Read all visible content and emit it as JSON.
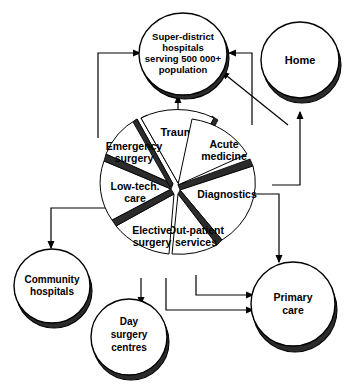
{
  "diagram": {
    "type": "pie-with-satellite-nodes",
    "colors": {
      "fill": "#ffffff",
      "outline": "#000000",
      "shadow": "#2b2b2b",
      "background": "#ffffff"
    },
    "pie": {
      "center_label": "",
      "slices": [
        {
          "id": "trauma",
          "label": "Trauma",
          "label_line1": "Trauma",
          "label_line2": "",
          "exploded": true,
          "start_deg": -73,
          "end_deg": -28
        },
        {
          "id": "acute-medicine",
          "label": "Acute medicine",
          "label_line1": "Acute",
          "label_line2": "medicine",
          "exploded": false,
          "start_deg": -25,
          "end_deg": 22
        },
        {
          "id": "diagnostics",
          "label": "Diagnostics",
          "label_line1": "Diagnostics",
          "label_line2": "",
          "exploded": false,
          "start_deg": 26,
          "end_deg": 76
        },
        {
          "id": "out-patient",
          "label": "Out-patient services",
          "label_line1": "Out-patient",
          "label_line2": "services",
          "exploded": false,
          "start_deg": 80,
          "end_deg": 128
        },
        {
          "id": "elective-surgery",
          "label": "Elective surgery",
          "label_line1": "Elective",
          "label_line2": "surgery",
          "exploded": false,
          "start_deg": 132,
          "end_deg": 180
        },
        {
          "id": "low-tech-care",
          "label": "Low-tech. care",
          "label_line1": "Low-tech.",
          "label_line2": "care",
          "exploded": false,
          "start_deg": 184,
          "end_deg": 232
        },
        {
          "id": "emergency-surgery",
          "label": "Emergency surgery",
          "label_line1": "Emergency",
          "label_line2": "surgery",
          "exploded": false,
          "start_deg": 236,
          "end_deg": 283
        }
      ]
    },
    "nodes": [
      {
        "id": "super-district-hospitals",
        "lines": [
          "Super-district",
          "hospitals",
          "serving 500 000+",
          "population"
        ],
        "position": "top-center"
      },
      {
        "id": "home",
        "lines": [
          "Home"
        ],
        "position": "top-right"
      },
      {
        "id": "community-hospitals",
        "lines": [
          "Community",
          "hospitals"
        ],
        "position": "bottom-left"
      },
      {
        "id": "day-surgery-centres",
        "lines": [
          "Day",
          "surgery",
          "centres"
        ],
        "position": "bottom-center"
      },
      {
        "id": "primary-care",
        "lines": [
          "Primary",
          "care"
        ],
        "position": "bottom-right"
      }
    ],
    "connectors": [
      {
        "id": "emergency-surgery-to-super-district",
        "from": "emergency-surgery",
        "to": "super-district-hospitals"
      },
      {
        "id": "trauma-to-super-district",
        "from": "trauma",
        "to": "super-district-hospitals"
      },
      {
        "id": "acute-medicine-to-super-district",
        "from": "acute-medicine",
        "to": "super-district-hospitals"
      },
      {
        "id": "home-to-super-district",
        "from": "home",
        "to": "super-district-hospitals"
      },
      {
        "id": "acute-medicine-to-home",
        "from": "acute-medicine",
        "to": "home"
      },
      {
        "id": "low-tech-care-to-community",
        "from": "low-tech-care",
        "to": "community-hospitals"
      },
      {
        "id": "elective-surgery-to-day-surgery",
        "from": "elective-surgery",
        "to": "day-surgery-centres"
      },
      {
        "id": "out-patient-to-primary-care",
        "from": "out-patient",
        "to": "primary-care"
      },
      {
        "id": "elective-surgery-to-primary-care",
        "from": "elective-surgery",
        "to": "primary-care"
      },
      {
        "id": "diagnostics-to-primary-care",
        "from": "diagnostics",
        "to": "primary-care"
      }
    ]
  }
}
